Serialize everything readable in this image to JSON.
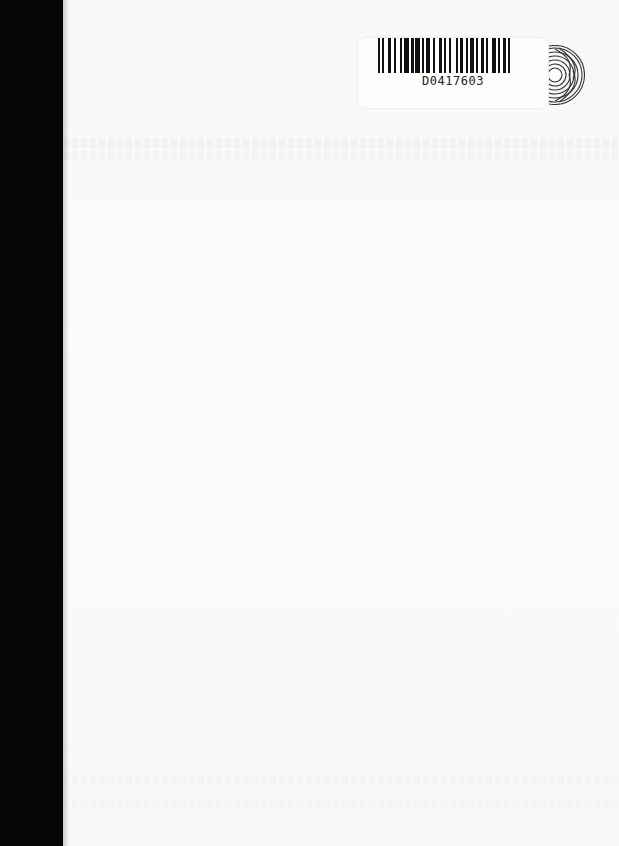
{
  "document": {
    "type": "book page (blank, with library barcode label)",
    "background_color": "#f9f9f9",
    "spine_color": "#050505"
  },
  "barcode_label": {
    "code": "D0417603",
    "bar_color": "#111111"
  },
  "emblem": {
    "icon": "concentric-arc-disc-icon",
    "color": "#333333"
  }
}
